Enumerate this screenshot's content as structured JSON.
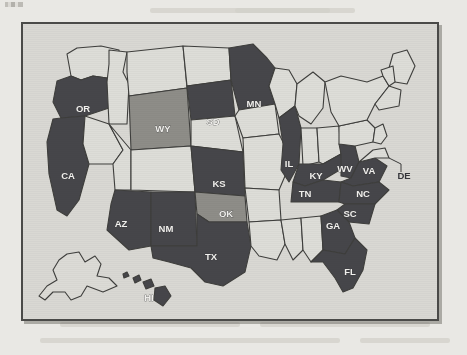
{
  "figure": {
    "caption_visible": false,
    "frame_color": "#4a4a48",
    "page_background": "#e9e8e4",
    "map_background": "#d9d8d3"
  },
  "legend_colors": {
    "highlighted_dark": "#46464a",
    "highlighted_medium": "#8e8d88",
    "unhighlighted": "#ddddd8",
    "border": "#3e3e3c",
    "label_light": "#f2f1ee",
    "label_dark": "#35353a"
  },
  "map": {
    "title_visible": false,
    "region": "United States",
    "insets": [
      "Alaska",
      "Hawaii"
    ],
    "states": [
      {
        "code": "WA",
        "label": "",
        "shade": "none",
        "lx": 0,
        "ly": 0
      },
      {
        "code": "OR",
        "label": "OR",
        "shade": "dark",
        "lx": 60,
        "ly": 85
      },
      {
        "code": "CA",
        "label": "CA",
        "shade": "dark",
        "lx": 45,
        "ly": 152
      },
      {
        "code": "ID",
        "label": "",
        "shade": "none",
        "lx": 0,
        "ly": 0
      },
      {
        "code": "NV",
        "label": "",
        "shade": "none",
        "lx": 0,
        "ly": 0
      },
      {
        "code": "UT",
        "label": "",
        "shade": "none",
        "lx": 0,
        "ly": 0
      },
      {
        "code": "AZ",
        "label": "AZ",
        "shade": "dark",
        "lx": 98,
        "ly": 200
      },
      {
        "code": "MT",
        "label": "",
        "shade": "none",
        "lx": 0,
        "ly": 0
      },
      {
        "code": "WY",
        "label": "WY",
        "shade": "mid",
        "lx": 140,
        "ly": 105
      },
      {
        "code": "CO",
        "label": "",
        "shade": "none",
        "lx": 0,
        "ly": 0
      },
      {
        "code": "NM",
        "label": "NM",
        "shade": "dark",
        "lx": 143,
        "ly": 205
      },
      {
        "code": "ND",
        "label": "",
        "shade": "none",
        "lx": 0,
        "ly": 0
      },
      {
        "code": "SD",
        "label": "SD",
        "shade": "dark",
        "lx": 190,
        "ly": 98
      },
      {
        "code": "NE",
        "label": "",
        "shade": "none",
        "lx": 0,
        "ly": 0
      },
      {
        "code": "KS",
        "label": "KS",
        "shade": "dark",
        "lx": 196,
        "ly": 160
      },
      {
        "code": "OK",
        "label": "OK",
        "shade": "mid",
        "lx": 203,
        "ly": 190
      },
      {
        "code": "TX",
        "label": "TX",
        "shade": "dark",
        "lx": 188,
        "ly": 233
      },
      {
        "code": "MN",
        "label": "MN",
        "shade": "dark",
        "lx": 231,
        "ly": 80
      },
      {
        "code": "IA",
        "label": "",
        "shade": "none",
        "lx": 0,
        "ly": 0
      },
      {
        "code": "MO",
        "label": "",
        "shade": "none",
        "lx": 0,
        "ly": 0
      },
      {
        "code": "AR",
        "label": "",
        "shade": "none",
        "lx": 0,
        "ly": 0
      },
      {
        "code": "LA",
        "label": "",
        "shade": "none",
        "lx": 0,
        "ly": 0
      },
      {
        "code": "WI",
        "label": "",
        "shade": "none",
        "lx": 0,
        "ly": 0
      },
      {
        "code": "IL",
        "label": "IL",
        "shade": "dark",
        "lx": 262,
        "ly": 140
      },
      {
        "code": "MS",
        "label": "",
        "shade": "none",
        "lx": 0,
        "ly": 0
      },
      {
        "code": "AL",
        "label": "",
        "shade": "none",
        "lx": 0,
        "ly": 0
      },
      {
        "code": "MI",
        "label": "",
        "shade": "none",
        "lx": 0,
        "ly": 0
      },
      {
        "code": "IN",
        "label": "",
        "shade": "none",
        "lx": 0,
        "ly": 0
      },
      {
        "code": "OH",
        "label": "",
        "shade": "none",
        "lx": 0,
        "ly": 0
      },
      {
        "code": "KY",
        "label": "KY",
        "shade": "dark",
        "lx": 291,
        "ly": 157
      },
      {
        "code": "TN",
        "label": "TN",
        "shade": "dark",
        "lx": 281,
        "ly": 177
      },
      {
        "code": "GA",
        "label": "GA",
        "shade": "dark",
        "lx": 310,
        "ly": 202
      },
      {
        "code": "FL",
        "label": "FL",
        "shade": "dark",
        "lx": 327,
        "ly": 248
      },
      {
        "code": "SC",
        "label": "SC",
        "shade": "dark",
        "lx": 325,
        "ly": 186
      },
      {
        "code": "NC",
        "label": "NC",
        "shade": "dark",
        "lx": 337,
        "ly": 168
      },
      {
        "code": "VA",
        "label": "VA",
        "shade": "dark",
        "lx": 340,
        "ly": 150
      },
      {
        "code": "WV",
        "label": "WV",
        "shade": "dark",
        "lx": 318,
        "ly": 148
      },
      {
        "code": "PA",
        "label": "",
        "shade": "none",
        "lx": 0,
        "ly": 0
      },
      {
        "code": "NY",
        "label": "",
        "shade": "none",
        "lx": 0,
        "ly": 0
      },
      {
        "code": "ME",
        "label": "",
        "shade": "none",
        "lx": 0,
        "ly": 0
      },
      {
        "code": "AK",
        "label": "",
        "shade": "outline",
        "lx": 0,
        "ly": 0
      },
      {
        "code": "HI",
        "label": "HI",
        "shade": "dark",
        "lx": 126,
        "ly": 274
      }
    ],
    "external_labels": [
      {
        "code": "DE",
        "label": "DE",
        "x": 381,
        "y": 152
      }
    ]
  }
}
